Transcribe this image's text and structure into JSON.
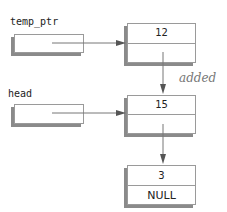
{
  "diagram": {
    "type": "linked-list",
    "pointers": [
      {
        "name": "temp_ptr",
        "points_to_node": 0
      },
      {
        "name": "head",
        "points_to_node": 1
      }
    ],
    "nodes": [
      {
        "data": "12",
        "next": ""
      },
      {
        "data": "15",
        "next": ""
      },
      {
        "data": "3",
        "next": "NULL"
      }
    ],
    "annotation": "added",
    "colors": {
      "line": "#777777",
      "border": "#9a9a9a",
      "shadow": "#8a8a8a",
      "text": "#222222"
    }
  }
}
